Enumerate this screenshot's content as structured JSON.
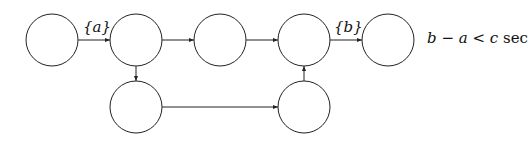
{
  "diagram": {
    "nodes": [
      {
        "id": "n1",
        "cx": 52,
        "cy": 40
      },
      {
        "id": "n2",
        "cx": 136,
        "cy": 40
      },
      {
        "id": "n3",
        "cx": 220,
        "cy": 40
      },
      {
        "id": "n4",
        "cx": 304,
        "cy": 40
      },
      {
        "id": "n5",
        "cx": 388,
        "cy": 40
      },
      {
        "id": "n6",
        "cx": 136,
        "cy": 107
      },
      {
        "id": "n7",
        "cx": 304,
        "cy": 107
      }
    ],
    "edges": [
      {
        "from": "n1",
        "to": "n2",
        "label": "{a}"
      },
      {
        "from": "n2",
        "to": "n3",
        "label": ""
      },
      {
        "from": "n3",
        "to": "n4",
        "label": ""
      },
      {
        "from": "n4",
        "to": "n5",
        "label": "{b}"
      },
      {
        "from": "n2",
        "to": "n6",
        "label": ""
      },
      {
        "from": "n6",
        "to": "n7",
        "label": ""
      },
      {
        "from": "n7",
        "to": "n4",
        "label": ""
      }
    ],
    "edge_label_a": "{a}",
    "edge_label_b": "{b}",
    "constraint": {
      "b": "b",
      "minus": " − ",
      "a": "a",
      "lt": " < ",
      "c": "c",
      "unit": " sec"
    }
  }
}
